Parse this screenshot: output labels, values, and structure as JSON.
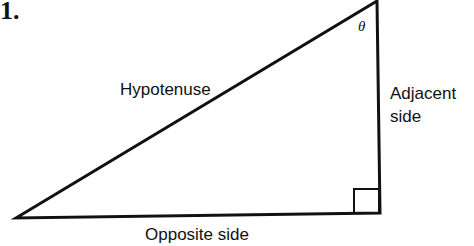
{
  "figure_number": "1.",
  "labels": {
    "hypotenuse": "Hypotenuse",
    "adjacent_line1": "Adjacent",
    "adjacent_line2": "side",
    "opposite": "Opposite side",
    "angle": "θ"
  },
  "colors": {
    "stroke": "#111111",
    "background": "#ffffff"
  }
}
